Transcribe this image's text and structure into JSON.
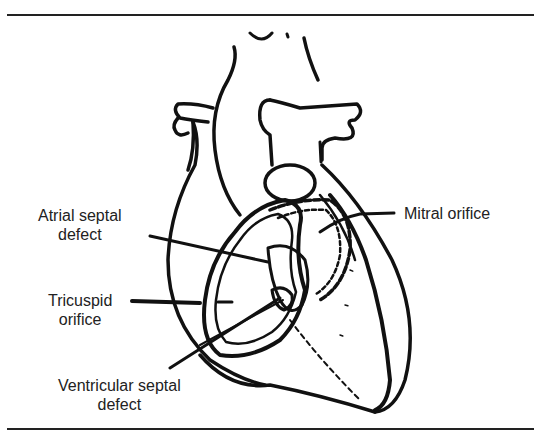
{
  "figure": {
    "labels": {
      "atrial_septal_defect": {
        "line1": "Atrial septal",
        "line2": "defect"
      },
      "tricuspid_orifice": {
        "line1": "Tricuspid",
        "line2": "orifice"
      },
      "mitral_orifice": {
        "line1": "Mitral orifice"
      },
      "ventricular_septal_defect": {
        "line1": "Ventricular septal",
        "line2": "defect"
      }
    }
  }
}
